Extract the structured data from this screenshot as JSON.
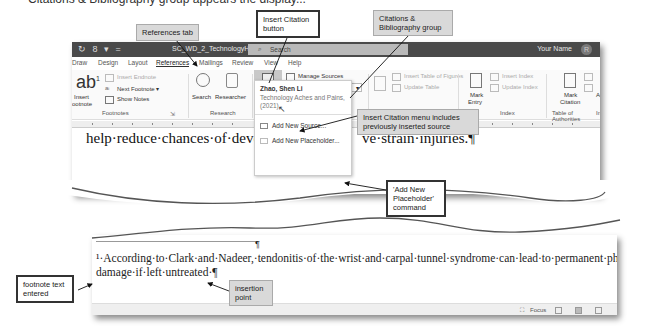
{
  "header_cut_text": "Citations & Bibliography group appears the display...",
  "window": {
    "quick_access": "↻ 8 ▾ =",
    "doc_title": "SC_WD_2_TechnologyHe... ▾",
    "search_placeholder": "Search",
    "user_name": "Your Name",
    "avatar_glyph": "R"
  },
  "tabs": [
    {
      "label": "Draw"
    },
    {
      "label": "Design"
    },
    {
      "label": "Layout"
    },
    {
      "label": "References",
      "active": true
    },
    {
      "label": "Mailings"
    },
    {
      "label": "Review"
    },
    {
      "label": "View"
    },
    {
      "label": "Help"
    }
  ],
  "ribbon": {
    "footnotes": {
      "insert_footnote": "Insert\nFootnote",
      "insert_footnote_l1": "Insert",
      "insert_footnote_l2": "ootnote",
      "insert_endnote": "Insert Endnote",
      "next_footnote": "Next Footnote ▾",
      "show_notes": "Show Notes",
      "group_label": "Footnotes"
    },
    "research": {
      "search": "Search",
      "researcher": "Researcher",
      "group_label": "Research"
    },
    "citations": {
      "insert_citation_l1": "Insert",
      "insert_citation_l2": "Citation ▾",
      "manage_sources": "Manage Sources",
      "style_label": "Style:",
      "style_value": "MLA",
      "bibliography": "Bibliography ▾"
    },
    "captions": {
      "insert_table_of_figures": "Insert Table of Figures",
      "update_table": "Update Table"
    },
    "index": {
      "mark_entry_l1": "Mark",
      "mark_entry_l2": "Entry",
      "insert_index": "Insert Index",
      "update_index": "Update Index",
      "group_label": "Index"
    },
    "toa": {
      "mark_citation_l1": "Mark",
      "mark_citation_l2": "Citation",
      "group_label": "Table of Authorities"
    },
    "cut_label_a": "Ac",
    "cut_label_b": "In"
  },
  "citation_menu": {
    "source_author": "Zhao, Shen Li",
    "source_title": "Technology Aches and Pains, (2021)",
    "add_new_source": "Add New Source...",
    "add_new_placeholder": "Add New Placeholder..."
  },
  "document": {
    "line1": "help·reduce·chances·of·developing·repetitive·strain·injuries.¶",
    "line1_left": "help·reduce·chances·of·develo",
    "line1_right": "ve·strain·injuries.¶",
    "footnote_line1": "¹·According·to·Clark·and·Nadeer,·tendonitis·of·the·wrist·and·carpal·tunnel·syndrome·can·lead·to·permanent·physical·",
    "footnote_line2": "damage·if·left·untreated·¶"
  },
  "status_bar": {
    "focus_label": "Focus"
  },
  "callouts": {
    "references_tab": "References tab",
    "insert_citation_button": "Insert Citation button",
    "citations_group": "Citations & Bibliography group",
    "menu_includes": "Insert Citation menu includes previously inserted source",
    "add_new_placeholder_cmd": "'Add New Placeholder' command",
    "footnote_text_entered": "footnote text entered",
    "insertion_point": "insertion point"
  }
}
